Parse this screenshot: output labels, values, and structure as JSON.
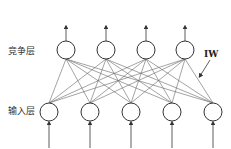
{
  "diagram": {
    "type": "competitive-neural-network",
    "layers": {
      "competitive": {
        "label": "竞争层",
        "nodes": 4
      },
      "input": {
        "label": "输入层",
        "nodes": 5
      }
    },
    "weights_label": "IW",
    "connections": "fully-connected input-to-competitive",
    "colors": {
      "stroke": "#444444",
      "background": "#ffffff"
    }
  }
}
